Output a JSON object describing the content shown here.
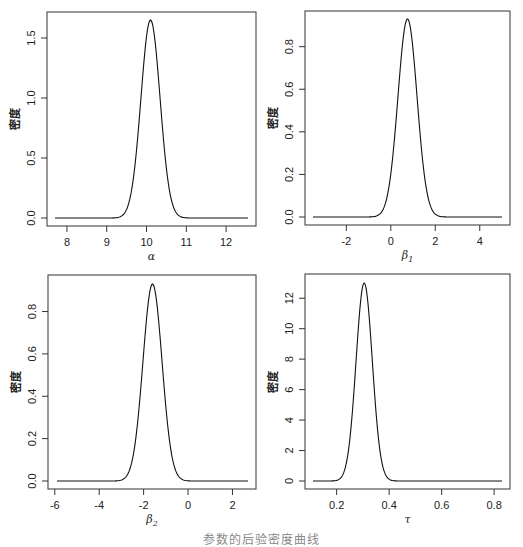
{
  "figure": {
    "caption": "参数的后验密度曲线",
    "line_color": "#111111",
    "frame_color": "#333333"
  },
  "chart_data": [
    {
      "type": "line",
      "title": "",
      "xlabel": "α",
      "xlabel_sub": "",
      "ylabel": "密度",
      "xlim": [
        7.7,
        12.55
      ],
      "ylim": [
        0.0,
        1.65
      ],
      "xticks": [
        8,
        9,
        10,
        11,
        12
      ],
      "xtick_labels": [
        "8",
        "9",
        "10",
        "11",
        "12"
      ],
      "yticks": [
        0.0,
        0.5,
        1.0,
        1.5
      ],
      "ytick_labels": [
        "0.0",
        "0.5",
        "1.0",
        "1.5"
      ],
      "grid": false,
      "peak": {
        "x": 10.1,
        "y": 1.65
      },
      "sd": 0.24,
      "box": {
        "x0": 47,
        "y0": 12,
        "x1": 256,
        "y1": 226
      },
      "px": {
        "xmin": 55,
        "xmax": 248,
        "ymin": 218,
        "ymax": 20
      }
    },
    {
      "type": "line",
      "title": "",
      "xlabel": "β",
      "xlabel_sub": "1",
      "ylabel": "密度",
      "xlim": [
        -3.5,
        5.0
      ],
      "ylim": [
        0.0,
        0.93
      ],
      "xticks": [
        -2,
        0,
        2,
        4
      ],
      "xtick_labels": [
        "-2",
        "0",
        "2",
        "4"
      ],
      "yticks": [
        0.0,
        0.2,
        0.4,
        0.6,
        0.8
      ],
      "ytick_labels": [
        "0.0",
        "0.2",
        "0.4",
        "0.6",
        "0.8"
      ],
      "grid": false,
      "peak": {
        "x": 0.75,
        "y": 0.93
      },
      "sd": 0.43,
      "box": {
        "x0": 305,
        "y0": 11,
        "x1": 510,
        "y1": 225
      },
      "px": {
        "xmin": 313,
        "xmax": 502,
        "ymin": 217,
        "ymax": 19
      }
    },
    {
      "type": "line",
      "title": "",
      "xlabel": "β",
      "xlabel_sub": "2",
      "ylabel": "密度",
      "xlim": [
        -5.9,
        2.7
      ],
      "ylim": [
        0.0,
        0.93
      ],
      "xticks": [
        -6,
        -4,
        -2,
        0,
        2
      ],
      "xtick_labels": [
        "-6",
        "-4",
        "-2",
        "0",
        "2"
      ],
      "yticks": [
        0.0,
        0.2,
        0.4,
        0.6,
        0.8
      ],
      "ytick_labels": [
        "0.0",
        "0.2",
        "0.4",
        "0.6",
        "0.8"
      ],
      "grid": false,
      "peak": {
        "x": -1.6,
        "y": 0.93
      },
      "sd": 0.43,
      "box": {
        "x0": 48,
        "y0": 275,
        "x1": 256,
        "y1": 489
      },
      "px": {
        "xmin": 57,
        "xmax": 248,
        "ymin": 481,
        "ymax": 284
      }
    },
    {
      "type": "line",
      "title": "",
      "xlabel": "τ",
      "xlabel_sub": "",
      "ylabel": "密度",
      "xlim": [
        0.11,
        0.83
      ],
      "ylim": [
        0,
        13
      ],
      "xticks": [
        0.2,
        0.4,
        0.6,
        0.8
      ],
      "xtick_labels": [
        "0.2",
        "0.4",
        "0.6",
        "0.8"
      ],
      "yticks": [
        0,
        2,
        4,
        6,
        8,
        10,
        12
      ],
      "ytick_labels": [
        "0",
        "2",
        "4",
        "6",
        "8",
        "10",
        "12"
      ],
      "grid": false,
      "peak": {
        "x": 0.305,
        "y": 13.0
      },
      "sd": 0.031,
      "box": {
        "x0": 305,
        "y0": 274,
        "x1": 510,
        "y1": 489
      },
      "px": {
        "xmin": 313,
        "xmax": 502,
        "ymin": 481,
        "ymax": 283
      }
    }
  ]
}
